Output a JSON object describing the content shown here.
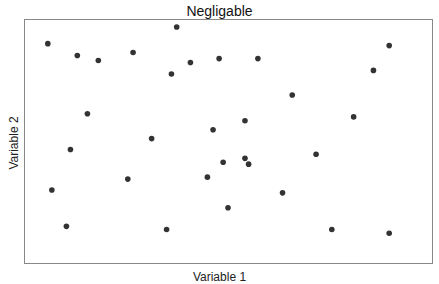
{
  "chart_data": {
    "type": "scatter",
    "title": "Negligable",
    "xlabel": "Variable 1",
    "ylabel": "Variable 2",
    "grid": false,
    "ticks": false,
    "legend": null,
    "xlim": [
      0,
      100
    ],
    "ylim": [
      0,
      100
    ],
    "point_color": "#333333",
    "points": [
      {
        "x": 5.4,
        "y": 90.6
      },
      {
        "x": 12.7,
        "y": 85.7
      },
      {
        "x": 17.9,
        "y": 83.6
      },
      {
        "x": 26.5,
        "y": 86.9
      },
      {
        "x": 37.3,
        "y": 97.5
      },
      {
        "x": 36.0,
        "y": 78.0
      },
      {
        "x": 40.7,
        "y": 82.8
      },
      {
        "x": 47.8,
        "y": 84.4
      },
      {
        "x": 57.4,
        "y": 84.4
      },
      {
        "x": 89.9,
        "y": 89.8
      },
      {
        "x": 86.0,
        "y": 79.5
      },
      {
        "x": 65.9,
        "y": 69.3
      },
      {
        "x": 15.2,
        "y": 61.5
      },
      {
        "x": 81.1,
        "y": 60.2
      },
      {
        "x": 54.2,
        "y": 58.6
      },
      {
        "x": 46.3,
        "y": 54.9
      },
      {
        "x": 31.1,
        "y": 51.2
      },
      {
        "x": 11.0,
        "y": 46.7
      },
      {
        "x": 71.8,
        "y": 44.7
      },
      {
        "x": 48.8,
        "y": 41.4
      },
      {
        "x": 54.2,
        "y": 43.0
      },
      {
        "x": 55.1,
        "y": 40.6
      },
      {
        "x": 6.4,
        "y": 29.9
      },
      {
        "x": 25.2,
        "y": 34.4
      },
      {
        "x": 44.9,
        "y": 35.2
      },
      {
        "x": 63.5,
        "y": 28.7
      },
      {
        "x": 50.0,
        "y": 22.5
      },
      {
        "x": 10.0,
        "y": 14.8
      },
      {
        "x": 34.8,
        "y": 13.5
      },
      {
        "x": 75.7,
        "y": 13.5
      },
      {
        "x": 89.9,
        "y": 11.9
      }
    ]
  }
}
